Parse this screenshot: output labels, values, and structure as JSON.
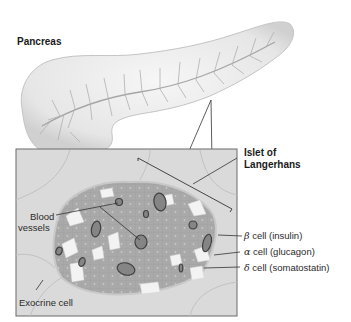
{
  "figure": {
    "organ_label": "Pancreas",
    "inset_label": "Islet of Langerhans",
    "inset_label_lines": [
      "Islet of",
      "Langerhans"
    ],
    "labels": {
      "blood_vessels": [
        "Blood",
        "vessels"
      ],
      "exocrine_cell": "Exocrine cell",
      "beta_cell": {
        "symbol": "β",
        "text": " cell (insulin)"
      },
      "alpha_cell": {
        "symbol": "α",
        "text": " cell (glucagon)"
      },
      "delta_cell": {
        "symbol": "δ",
        "text": " cell (somatostatin)"
      }
    },
    "colors": {
      "organ_fill": "#ededed",
      "organ_edge": "#b8b8b8",
      "duct": "#a8a8a8",
      "inset_bg": "#d9d9d9",
      "islet_beta": "#a6a6a6",
      "alpha_cells": "#f4f4f4",
      "vessel": "#808080",
      "vessel_edge": "#444444",
      "leader": "#333333"
    }
  }
}
